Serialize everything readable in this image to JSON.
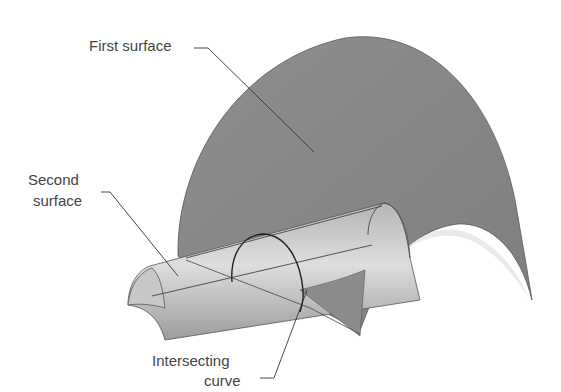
{
  "diagram": {
    "type": "3d-surface-intersection",
    "labels": {
      "first_surface": "First surface",
      "second_surface_line1": "Second",
      "second_surface_line2": "surface",
      "intersecting_curve_line1": "Intersecting",
      "intersecting_curve_line2": "curve"
    },
    "colors": {
      "background": "#ffffff",
      "first_surface_fill": "#8a8a8a",
      "second_surface_fill_light": "#d6d6d6",
      "second_surface_fill_dark": "#9a9a9a",
      "outline": "#333333",
      "text": "#444444"
    }
  }
}
